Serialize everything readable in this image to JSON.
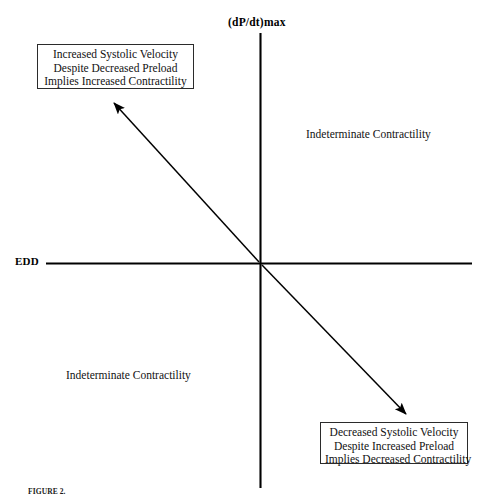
{
  "figure": {
    "axes": {
      "y_axis_label": "(dP/dt)max",
      "x_axis_label": "EDD"
    },
    "quadrant_labels": [
      {
        "id": "upper-right",
        "text": "Indeterminate Contractility"
      },
      {
        "id": "lower-left",
        "text": "Indeterminate Contractility"
      }
    ],
    "callouts": [
      {
        "id": "top-left",
        "lines": [
          "Increased Systolic Velocity",
          "Despite Decreased Preload",
          "Implies Increased Contractility"
        ]
      },
      {
        "id": "bottom-right",
        "lines": [
          "Decreased Systolic Velocity",
          "Despite Increased Preload",
          "Implies Decreased Contractility"
        ]
      }
    ],
    "arrows": [
      {
        "id": "upper-left-arrow",
        "from": "origin",
        "to": "top-left-callout"
      },
      {
        "id": "lower-right-arrow",
        "from": "origin",
        "to": "bottom-right-callout"
      }
    ],
    "caption": {
      "lead": "FIGURE 2.",
      "text": ""
    },
    "colors": {
      "line": "#000000",
      "box_border": "#2b2b2b",
      "text": "#111111",
      "background": "#ffffff"
    }
  }
}
